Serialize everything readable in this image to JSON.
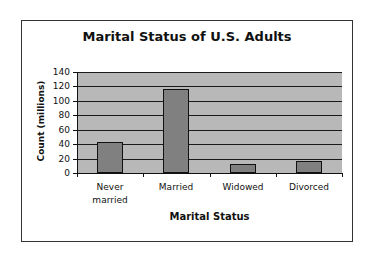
{
  "chart_data": {
    "type": "bar",
    "title": "Marital Status of U.S. Adults",
    "xlabel": "Marital Status",
    "ylabel": "Count (millions)",
    "categories": [
      "Never married",
      "Married",
      "Widowed",
      "Divorced"
    ],
    "category_lines": [
      [
        "Never",
        "married"
      ],
      [
        "Married"
      ],
      [
        "Widowed"
      ],
      [
        "Divorced"
      ]
    ],
    "values": [
      43,
      117,
      13,
      17
    ],
    "ylim": [
      0,
      140
    ],
    "yticks": [
      0,
      20,
      40,
      60,
      80,
      100,
      120,
      140
    ],
    "grid": true,
    "legend": null,
    "colors": {
      "bar": "#808080",
      "plot_background": "#b8b8b8",
      "gridline": "#1a1a1a"
    }
  }
}
